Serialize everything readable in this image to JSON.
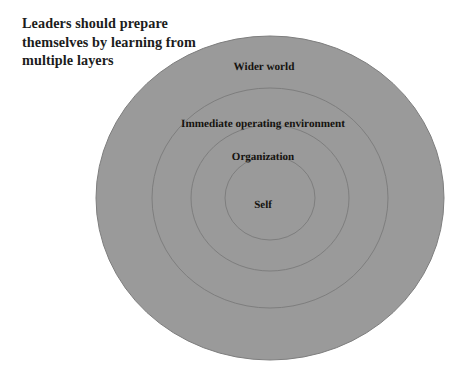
{
  "figure": {
    "name": "concentric-layers-diagram",
    "heading": "Leaders should prepare\nthemselves by learning from\nmultiple layers",
    "background_color": "#ffffff",
    "fill_color": "#9a9a9a",
    "stroke_color": "#7e7e7e",
    "label_color": "#15130f",
    "heading_color": "#1c1c1c",
    "center": {
      "x": 270,
      "y": 198
    },
    "rings": [
      {
        "label": "Wider world",
        "rx": 174,
        "ry": 162,
        "label_x": 264,
        "label_y": 61
      },
      {
        "label": "Immediate operating environment",
        "rx": 118,
        "ry": 110,
        "label_x": 263,
        "label_y": 118
      },
      {
        "label": "Organization",
        "rx": 79,
        "ry": 73,
        "label_x": 263,
        "label_y": 151
      },
      {
        "label": "Self",
        "rx": 45,
        "ry": 42,
        "label_x": 263,
        "label_y": 199
      }
    ]
  }
}
